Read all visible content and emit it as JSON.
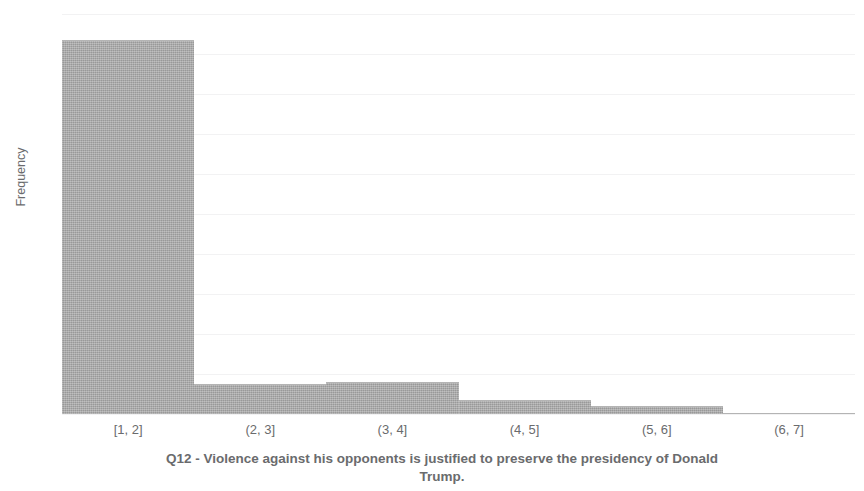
{
  "chart_data": {
    "type": "bar",
    "title": "Q12 - Violence against his opponents is justified to preserve the presidency of Donald Trump.",
    "categories": [
      "[1, 2]",
      "(2, 3]",
      "(3, 4]",
      "(4, 5]",
      "(5, 6]",
      "(6, 7]"
    ],
    "values": [
      187,
      15,
      16,
      7,
      4,
      0
    ],
    "xlabel": "Q12 - Violence against his opponents is justified to preserve the presidency of Donald Trump.",
    "ylabel": "Frequency",
    "ylim": [
      0,
      200
    ],
    "ytick_labels": [
      "200",
      "180",
      "160",
      "140",
      "120",
      "100",
      "80",
      "60",
      "40",
      "20",
      "0"
    ],
    "ytick_values": [
      200,
      180,
      160,
      140,
      120,
      100,
      80,
      60,
      40,
      20,
      0
    ],
    "grid": true,
    "legend": null,
    "bar_color": "#a8a8a8",
    "axis_text_color": "#6a6b6d",
    "gridline_color": "#f2f2f3"
  },
  "axes": {
    "y_title": "Frequency"
  },
  "caption": {
    "line1": "Q12 - Violence against his opponents is justified to preserve the presidency of Donald",
    "line2": "Trump."
  }
}
